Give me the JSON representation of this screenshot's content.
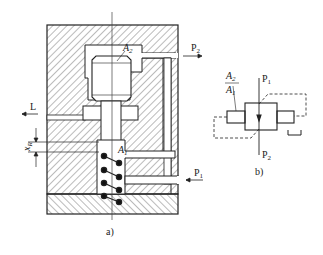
{
  "figure": {
    "panel_a": {
      "caption": "a)",
      "labels": {
        "A2": "A",
        "A2_sub": "2",
        "A1": "A",
        "A1_sub": "1",
        "P2": "P",
        "P2_sub": "2",
        "P1": "P",
        "P1_sub": "1",
        "L": "L",
        "xR": "x",
        "xR_sub": "R"
      }
    },
    "panel_b": {
      "caption": "b)",
      "labels": {
        "ratio_num": "A",
        "ratio_num_sub": "2",
        "ratio_den": "A",
        "ratio_den_sub": "1",
        "P1": "P",
        "P1_sub": "1",
        "P2": "P",
        "P2_sub": "2"
      }
    },
    "colors": {
      "line": "#222222",
      "hatch": "#555555",
      "background": "#ffffff"
    }
  }
}
